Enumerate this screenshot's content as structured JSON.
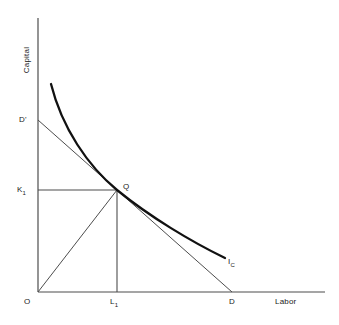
{
  "figure": {
    "type": "economics-isoquant-isocost-diagram",
    "background_color": "#ffffff",
    "axes": {
      "y_axis_label": "Capital",
      "x_axis_label": "Labor",
      "origin_label": "O",
      "axis_color": "#4d4d4d",
      "origin": [
        38,
        292
      ],
      "y_axis_top": [
        38,
        18
      ],
      "x_axis_right": [
        325,
        292
      ]
    },
    "labels": {
      "capital": "Capital",
      "labor": "Labor",
      "origin": "O",
      "isocost_intercept": "D'",
      "capital_quantity": "K",
      "capital_quantity_sub": "1",
      "labor_quantity": "L",
      "labor_quantity_sub": "1",
      "tangency_point": "Q",
      "isoquant": "I",
      "isoquant_sub": "C",
      "isocost_x_intercept": "D"
    },
    "curves": {
      "isoquant": {
        "name": "Ic",
        "label": "Ic",
        "color": "#111111",
        "stroke_width": 2.3,
        "start": [
          51,
          84
        ],
        "end": [
          225,
          258
        ],
        "shape": "convex-to-origin"
      },
      "isocost": {
        "name": "D'D",
        "color": "#4d4d4d",
        "stroke_width": 1,
        "start": [
          38,
          120
        ],
        "end": [
          232,
          292
        ],
        "shape": "straight-line"
      },
      "expansion_ray": {
        "name": "OQ",
        "color": "#4d4d4d",
        "stroke_width": 1,
        "start": [
          38,
          292
        ],
        "end": [
          117,
          190
        ]
      },
      "capital_guide": {
        "name": "K1-Q",
        "color": "#4d4d4d",
        "stroke_width": 1,
        "start": [
          38,
          190
        ],
        "end": [
          117,
          190
        ]
      },
      "labor_guide": {
        "name": "L1-Q",
        "color": "#4d4d4d",
        "stroke_width": 1,
        "start": [
          117,
          292
        ],
        "end": [
          117,
          190
        ]
      }
    },
    "points": {
      "tangency": {
        "label": "Q",
        "coords": [
          117,
          190
        ],
        "description": "tangency of isoquant and isocost"
      },
      "isocost_y_intercept": {
        "label": "D'",
        "coords": [
          38,
          120
        ]
      },
      "isocost_x_intercept": {
        "label": "D",
        "coords": [
          232,
          292
        ]
      },
      "capital_used": {
        "label": "K1",
        "coords": [
          38,
          190
        ]
      },
      "labor_used": {
        "label": "L1",
        "coords": [
          117,
          292
        ]
      }
    }
  }
}
